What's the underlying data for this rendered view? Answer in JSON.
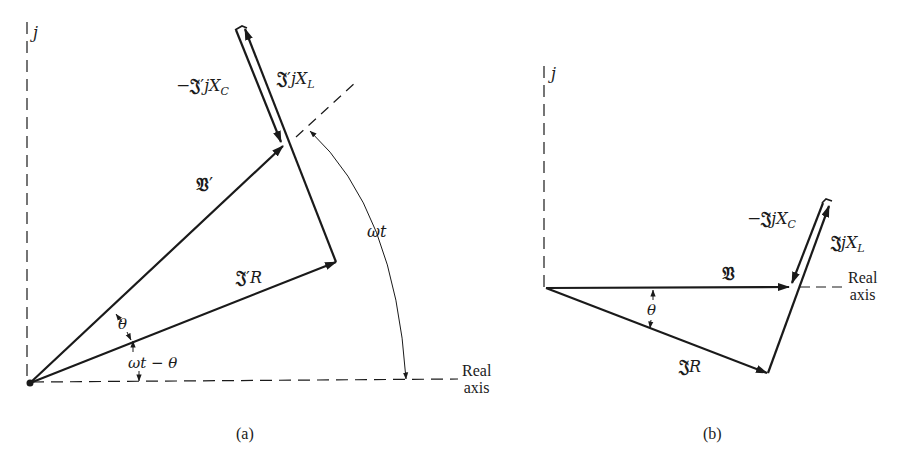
{
  "figure": {
    "panels": [
      {
        "id": "a",
        "caption": "(a)",
        "imag_axis_label": "j",
        "real_axis_label_line1": "Real",
        "real_axis_label_line2": "axis",
        "phasors": {
          "voltage": {
            "symbol": "𝔙",
            "prime": "′",
            "label": "𝔙′"
          },
          "resistive_drop": {
            "symbol": "𝔍",
            "prime": "′",
            "suffix": "R",
            "label": "𝔍′R"
          },
          "inductive_drop": {
            "symbol": "𝔍",
            "prime": "′",
            "mid": "jX",
            "subscript": "L",
            "label": "𝔍′jX_L"
          },
          "capacitive_drop": {
            "prefix": "−",
            "symbol": "𝔍",
            "prime": "′",
            "mid": "jX",
            "subscript": "C",
            "label": "−𝔍′jX_C"
          }
        },
        "angles": {
          "theta": "θ",
          "omega_t_minus_theta": "ωt − θ",
          "omega_t": "ωt"
        }
      },
      {
        "id": "b",
        "caption": "(b)",
        "imag_axis_label": "j",
        "real_axis_label_line1": "Real",
        "real_axis_label_line2": "axis",
        "phasors": {
          "voltage": {
            "symbol": "𝔙",
            "label": "𝔙"
          },
          "resistive_drop": {
            "symbol": "𝔍",
            "suffix": "R",
            "label": "𝔍R"
          },
          "inductive_drop": {
            "symbol": "𝔍",
            "mid": "jX",
            "subscript": "L",
            "label": "𝔍jX_L"
          },
          "capacitive_drop": {
            "prefix": "−",
            "symbol": "𝔍",
            "mid": "jX",
            "subscript": "C",
            "label": "−𝔍jX_C"
          }
        },
        "angles": {
          "theta": "θ"
        }
      }
    ]
  }
}
